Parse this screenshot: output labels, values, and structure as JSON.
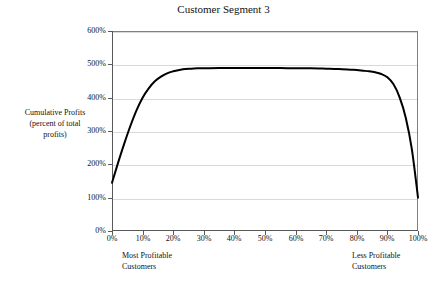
{
  "chart_data": {
    "type": "line",
    "title": "Customer Segment 3",
    "xlabel": "",
    "ylabel": "Cumulative Profits (percent of total profits)",
    "ylabel_lines": [
      "Cumulative Profits",
      "(percent of total",
      "profits)"
    ],
    "xlim": [
      0,
      100
    ],
    "ylim": [
      0,
      600
    ],
    "grid": true,
    "legend": "none",
    "x_tick_labels": [
      "0%",
      "10%",
      "20%",
      "30%",
      "40%",
      "50%",
      "60%",
      "70%",
      "80%",
      "90%",
      "100%"
    ],
    "x_tick_values": [
      0,
      10,
      20,
      30,
      40,
      50,
      60,
      70,
      80,
      90,
      100
    ],
    "y_tick_labels": [
      "0%",
      "100%",
      "200%",
      "300%",
      "400%",
      "500%",
      "600%"
    ],
    "y_tick_values": [
      0,
      100,
      200,
      300,
      400,
      500,
      600
    ],
    "annotations": [
      {
        "name": "left-axis-note",
        "lines": [
          "Most Profitable",
          "Customers"
        ],
        "at_x": 0
      },
      {
        "name": "right-axis-note",
        "lines": [
          "Less Profitable",
          "Customers"
        ],
        "at_x": 100
      }
    ],
    "series": [
      {
        "name": "Cumulative Profits",
        "color": "#000000",
        "line_width": 2,
        "x": [
          0,
          2,
          4,
          6,
          8,
          10,
          12,
          14,
          16,
          18,
          20,
          22,
          24,
          26,
          28,
          30,
          35,
          40,
          45,
          50,
          55,
          60,
          65,
          70,
          74,
          78,
          80,
          82,
          84,
          86,
          88,
          90,
          92,
          94,
          96,
          98,
          100
        ],
        "y": [
          145,
          205,
          262,
          315,
          362,
          400,
          428,
          449,
          463,
          473,
          479,
          483,
          486,
          487,
          488,
          488,
          489,
          489,
          489,
          489,
          489,
          488,
          488,
          487,
          486,
          484,
          483,
          481,
          479,
          476,
          471,
          461,
          440,
          401,
          340,
          245,
          100
        ]
      }
    ]
  },
  "colors": {
    "curve": "#000000",
    "gridline": "#d9d9d9",
    "axis": "#595959",
    "frame": "#808080",
    "text": "#111111",
    "background": "#ffffff"
  }
}
